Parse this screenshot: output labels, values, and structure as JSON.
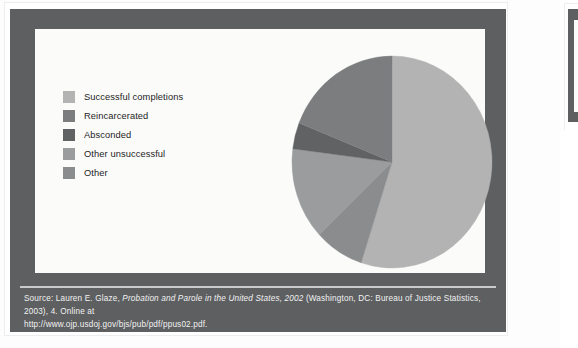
{
  "document": {
    "background_color": "#fdfdfd",
    "frame_color": "#5d5f61",
    "panel_color": "#fbfbfa",
    "rule_color": "#c9cacb",
    "caption_text_color": "#f2f2f2"
  },
  "caption": {
    "prefix": "Source: Lauren E. Glaze, ",
    "title_italic": "Probation and Parole in the United States, 2002",
    "suffix": " (Washington, DC: Bureau of Justice Statistics, 2003), 4. Online at",
    "url": "http://www.ojp.usdoj.gov/bjs/pub/pdf/ppus02.pdf."
  },
  "legend": {
    "items": [
      {
        "label": "Successful completions",
        "color": "#b3b3b3"
      },
      {
        "label": "Reincarcerated",
        "color": "#7b7d7f"
      },
      {
        "label": "Absconded",
        "color": "#606264"
      },
      {
        "label": "Other unsuccessful",
        "color": "#9a9c9e"
      },
      {
        "label": "Other",
        "color": "#8a8c8e"
      }
    ]
  },
  "chart_data": {
    "type": "pie",
    "title": "",
    "categories": [
      "Successful completions",
      "Other",
      "Other unsuccessful",
      "Absconded",
      "Reincarcerated"
    ],
    "values": [
      55,
      8,
      14,
      4,
      19
    ],
    "unit": "percent",
    "colors": [
      "#b3b3b3",
      "#8a8c8e",
      "#9a9c9e",
      "#606264",
      "#7b7d7f"
    ],
    "start_angle_deg": 0,
    "direction": "clockwise",
    "legend_position": "left",
    "grid": false,
    "labels_shown": false,
    "geometry": {
      "cx": 102,
      "cy": 107,
      "rx": 100,
      "ry": 106
    }
  }
}
